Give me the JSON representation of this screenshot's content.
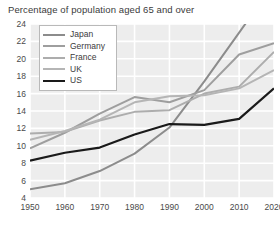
{
  "chart_data": {
    "type": "line",
    "title": "Percentage of population aged 65 and over",
    "xlabel": "",
    "ylabel": "",
    "xlim": [
      1950,
      2020
    ],
    "ylim": [
      4,
      24
    ],
    "grid": true,
    "legend_position": "top-left",
    "x": [
      1950,
      1960,
      1970,
      1980,
      1990,
      2000,
      2010,
      2020
    ],
    "xticks": [
      "1950",
      "1960",
      "1970",
      "1980",
      "1990",
      "2000",
      "2010",
      "2020"
    ],
    "yticks": [
      "4",
      "6",
      "8",
      "10",
      "12",
      "14",
      "16",
      "18",
      "20",
      "22",
      "24"
    ],
    "series": [
      {
        "name": "Japan",
        "color": "#8c8c8c",
        "width": 2.0,
        "values": [
          5.0,
          5.7,
          7.1,
          9.1,
          12.1,
          17.4,
          23.0,
          28.7
        ]
      },
      {
        "name": "Germany",
        "color": "#9e9e9e",
        "width": 2.0,
        "values": [
          9.7,
          11.5,
          13.7,
          15.6,
          15.0,
          16.4,
          20.5,
          21.8
        ]
      },
      {
        "name": "France",
        "color": "#adadad",
        "width": 2.0,
        "values": [
          11.4,
          11.6,
          12.9,
          13.9,
          14.1,
          16.0,
          16.8,
          20.8
        ]
      },
      {
        "name": "UK",
        "color": "#b5b5b5",
        "width": 2.0,
        "values": [
          10.7,
          11.7,
          13.0,
          15.0,
          15.7,
          15.8,
          16.6,
          18.7
        ]
      },
      {
        "name": "US",
        "color": "#1a1a1a",
        "width": 2.2,
        "values": [
          8.3,
          9.2,
          9.8,
          11.3,
          12.5,
          12.4,
          13.1,
          16.6
        ]
      }
    ]
  },
  "plot_style": {
    "background": "#ededed",
    "gridline_color": "#ffffff",
    "axis_text_color": "#4a4a4a",
    "title_color": "#3b3b3b",
    "legend_border": "#b9b9b9",
    "legend_background": "#ffffff"
  }
}
